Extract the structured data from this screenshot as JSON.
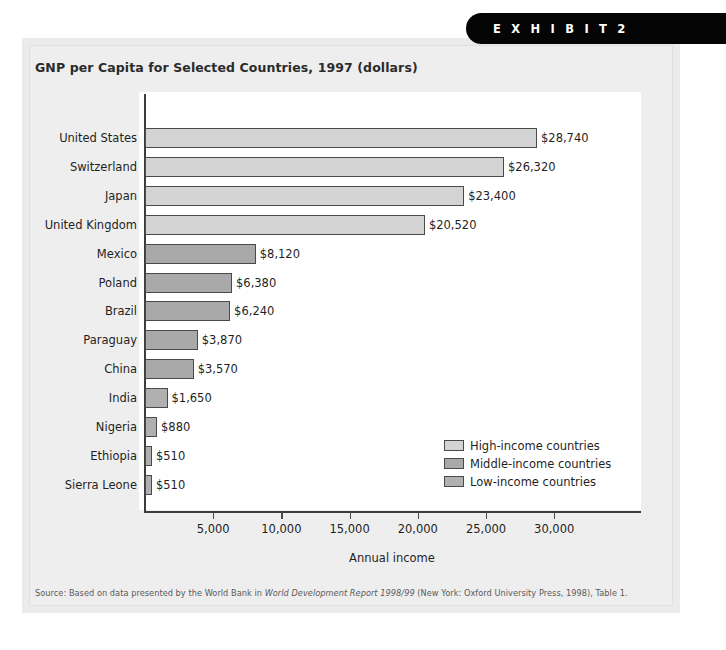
{
  "badge": {
    "label": "E X H I B I T   2"
  },
  "chart_title": "GNP per Capita for Selected Countries, 1997 (dollars)",
  "source_note": {
    "prefix": "Source: Based on data presented by the World Bank in ",
    "italic": "World Development Report 1998/99",
    "suffix": " (New York: Oxford University Press, 1998), Table 1."
  },
  "legend": {
    "items": [
      {
        "label": "High-income countries",
        "color": "#d4d4d4"
      },
      {
        "label": "Middle-income countries",
        "color": "#a9a9a9"
      },
      {
        "label": "Low-income countries",
        "color": "#b0b0b0"
      }
    ]
  },
  "chart_data": {
    "type": "bar",
    "orientation": "horizontal",
    "title": "GNP per Capita for Selected Countries, 1997 (dollars)",
    "xlabel": "Annual income",
    "ylabel": "",
    "xlim": [
      0,
      32500
    ],
    "grid": false,
    "legend_position": "inside-bottom-right",
    "xticks": [
      5000,
      10000,
      15000,
      20000,
      25000,
      30000
    ],
    "xticklabels": [
      "5,000",
      "10,000",
      "15,000",
      "20,000",
      "25,000",
      "30,000"
    ],
    "categories": [
      "United States",
      "Switzerland",
      "Japan",
      "United Kingdom",
      "Mexico",
      "Poland",
      "Brazil",
      "Paraguay",
      "China",
      "India",
      "Nigeria",
      "Ethiopia",
      "Sierra Leone"
    ],
    "values": [
      28740,
      26320,
      23400,
      20520,
      8120,
      6380,
      6240,
      3870,
      3570,
      1650,
      880,
      510,
      510
    ],
    "value_labels": [
      "$28,740",
      "$26,320",
      "$23,400",
      "$20,520",
      "$8,120",
      "$6,380",
      "$6,240",
      "$3,870",
      "$3,570",
      "$1,650",
      "$880",
      "$510",
      "$510"
    ],
    "groups": [
      "High-income countries",
      "High-income countries",
      "High-income countries",
      "High-income countries",
      "Middle-income countries",
      "Middle-income countries",
      "Middle-income countries",
      "Middle-income countries",
      "Middle-income countries",
      "Low-income countries",
      "Low-income countries",
      "Low-income countries",
      "Low-income countries"
    ],
    "group_colors": {
      "High-income countries": "#d4d4d4",
      "Middle-income countries": "#a9a9a9",
      "Low-income countries": "#b0b0b0"
    }
  }
}
